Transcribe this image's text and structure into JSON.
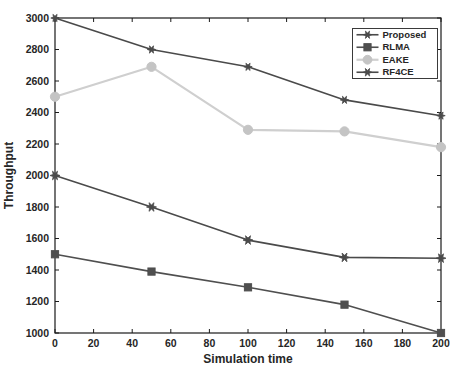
{
  "figure": {
    "background": "#ffffff",
    "axis_color": "#1a1a1a",
    "text_color": "#262626"
  },
  "chart_data": {
    "type": "line",
    "title": "",
    "xlabel": "Simulation time",
    "ylabel": "Throughput",
    "xlim": [
      0,
      200
    ],
    "ylim": [
      1000,
      3000
    ],
    "xticks": [
      0,
      20,
      40,
      60,
      80,
      100,
      120,
      140,
      160,
      180,
      200
    ],
    "yticks": [
      1000,
      1200,
      1400,
      1600,
      1800,
      2000,
      2200,
      2400,
      2600,
      2800,
      3000
    ],
    "grid": false,
    "legend_position": "top-right",
    "x": [
      0,
      50,
      100,
      150,
      200
    ],
    "series": [
      {
        "name": "Proposed",
        "values": [
          3000,
          2800,
          2690,
          2480,
          2380
        ],
        "color": "#4a4a4a",
        "marker": "hexagram",
        "marker_size": 4.2,
        "line_width": 1.6
      },
      {
        "name": "RLMA",
        "values": [
          1500,
          1390,
          1290,
          1180,
          1000
        ],
        "color": "#4f4f4f",
        "marker": "square",
        "marker_size": 3.6,
        "line_width": 1.6
      },
      {
        "name": "EAKE",
        "values": [
          2500,
          2690,
          2290,
          2280,
          2180
        ],
        "color": "#cfcfcf",
        "marker": "circle",
        "marker_size": 4.6,
        "line_width": 2.2,
        "marker_color": "#c4c4c4"
      },
      {
        "name": "RF4CE",
        "values": [
          2000,
          1800,
          1590,
          1480,
          1475
        ],
        "color": "#4a4a4a",
        "marker": "hexagram",
        "marker_size": 5.0,
        "line_width": 1.6
      }
    ]
  }
}
